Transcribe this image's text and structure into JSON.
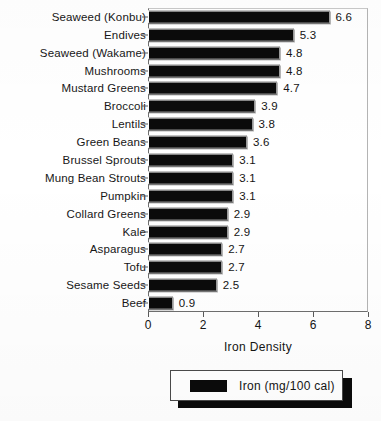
{
  "chart_data": {
    "type": "bar",
    "orientation": "horizontal",
    "title": "",
    "xlabel": "Iron Density",
    "ylabel": "",
    "xlim": [
      0,
      8
    ],
    "xticks": [
      0,
      2,
      4,
      6,
      8
    ],
    "xtick_labels": [
      "0",
      "2",
      "4",
      "6",
      "8"
    ],
    "grid": false,
    "legend_position": "below-axis-centered",
    "categories": [
      "Seaweed (Konbu)",
      "Endives",
      "Seaweed (Wakame)",
      "Mushrooms",
      "Mustard Greens",
      "Broccoli",
      "Lentils",
      "Green Beans",
      "Brussel Sprouts",
      "Mung Bean Strouts",
      "Pumpkin",
      "Collard Greens",
      "Kale",
      "Asparagus",
      "Tofu",
      "Sesame Seeds",
      "Beef"
    ],
    "values": [
      6.6,
      5.3,
      4.8,
      4.8,
      4.7,
      3.9,
      3.8,
      3.6,
      3.1,
      3.1,
      3.1,
      2.9,
      2.9,
      2.7,
      2.7,
      2.5,
      0.9
    ],
    "value_labels": [
      "6.6",
      "5.3",
      "4.8",
      "4.8",
      "4.7",
      "3.9",
      "3.8",
      "3.6",
      "3.1",
      "3.1",
      "3.1",
      "2.9",
      "2.9",
      "2.7",
      "2.7",
      "2.5",
      "0.9"
    ],
    "series": [
      {
        "name": "Iron (mg/100 cal)",
        "color": "#0b0b0b",
        "values": [
          6.6,
          5.3,
          4.8,
          4.8,
          4.7,
          3.9,
          3.8,
          3.6,
          3.1,
          3.1,
          3.1,
          2.9,
          2.9,
          2.7,
          2.7,
          2.5,
          0.9
        ]
      }
    ]
  },
  "legend": {
    "entries": [
      {
        "label": "Iron (mg/100 cal)",
        "color": "#0b0b0b"
      }
    ]
  },
  "axis": {
    "x_title": "Iron Density"
  },
  "colors": {
    "bar": "#0b0b0b",
    "background": "#ffffff",
    "text": "#141414",
    "frame": "#6e6e6e"
  }
}
